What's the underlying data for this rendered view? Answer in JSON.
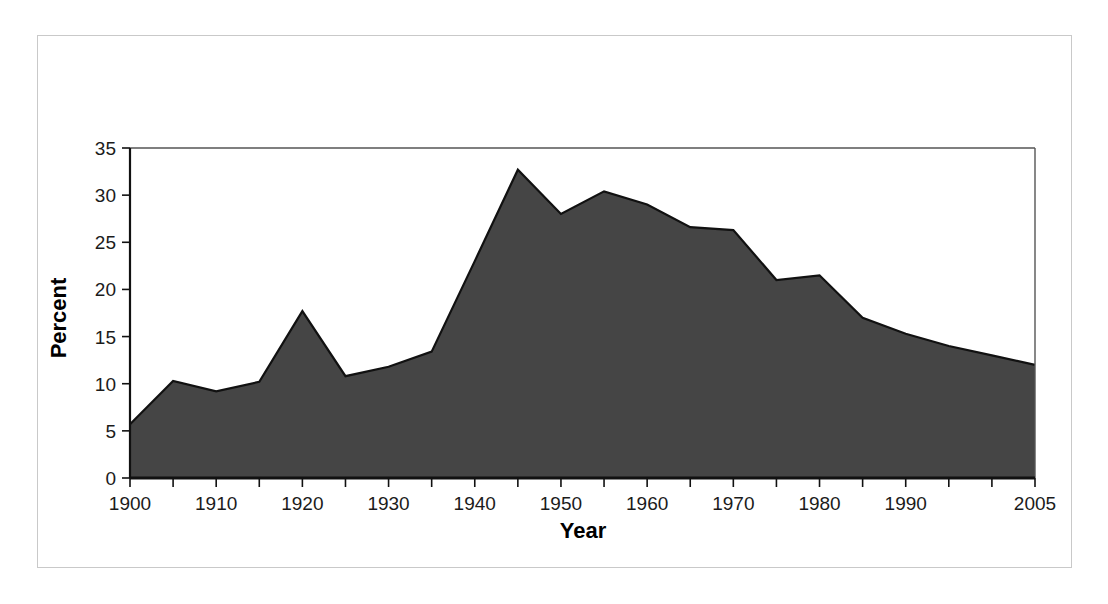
{
  "figure": {
    "background_color": "#ffffff",
    "frame_color": "#c9c9c9"
  },
  "chart_data": {
    "type": "area",
    "title": "",
    "subtitle": "",
    "xlabel": "Year",
    "ylabel": "Percent",
    "x": [
      1900,
      1905,
      1910,
      1915,
      1920,
      1925,
      1930,
      1935,
      1940,
      1945,
      1950,
      1955,
      1960,
      1965,
      1970,
      1975,
      1980,
      1985,
      1990,
      1995,
      2000,
      2005
    ],
    "values": [
      5.7,
      10.3,
      9.2,
      10.2,
      17.7,
      10.8,
      11.8,
      13.4,
      23.0,
      32.7,
      28.0,
      30.4,
      29.0,
      26.6,
      26.3,
      21.0,
      21.5,
      17.0,
      15.3,
      14.0,
      13.0,
      12.0
    ],
    "series": [
      {
        "name": "Percent",
        "values": [
          5.7,
          10.3,
          9.2,
          10.2,
          17.7,
          10.8,
          11.8,
          13.4,
          23.0,
          32.7,
          28.0,
          30.4,
          29.0,
          26.6,
          26.3,
          21.0,
          21.5,
          17.0,
          15.3,
          14.0,
          13.0,
          12.0
        ],
        "fill_color": "#454545",
        "line_color": "#111111"
      }
    ],
    "xlim": [
      1900,
      2005
    ],
    "ylim": [
      0,
      35
    ],
    "ytick_values": [
      0,
      5,
      10,
      15,
      20,
      25,
      30,
      35
    ],
    "ytick_labels": [
      "0",
      "5",
      "10",
      "15",
      "20",
      "25",
      "30",
      "35"
    ],
    "xtick_values": [
      1900,
      1905,
      1910,
      1915,
      1920,
      1925,
      1930,
      1935,
      1940,
      1945,
      1950,
      1955,
      1960,
      1965,
      1970,
      1975,
      1980,
      1985,
      1990,
      1995,
      2000,
      2005
    ],
    "xtick_labels": [
      "1900",
      "",
      "1910",
      "",
      "1920",
      "",
      "1930",
      "",
      "1940",
      "",
      "1950",
      "",
      "1960",
      "",
      "1970",
      "",
      "1980",
      "",
      "1990",
      "",
      "",
      "2005"
    ],
    "grid": false,
    "legend": null,
    "legend_position": "none",
    "annotations": []
  }
}
